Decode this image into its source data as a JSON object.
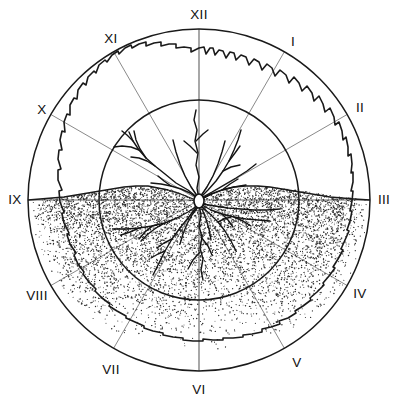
{
  "figure": {
    "background_color": "#ffffff",
    "line_color": "#1a1a1a",
    "spoke_color": "#8a8a8a",
    "stipple_color": "#2b2b2b"
  },
  "geometry": {
    "center_x": 199,
    "center_y": 200,
    "outer_radius": 171,
    "inner_radius": 100,
    "collar_radius_x": 5,
    "collar_radius_y": 7
  },
  "hour_labels": [
    {
      "id": "XII",
      "text": "XII",
      "angle_deg": 0,
      "x": 199,
      "y": 14
    },
    {
      "id": "I",
      "text": "I",
      "angle_deg": 30,
      "x": 293,
      "y": 41
    },
    {
      "id": "II",
      "text": "II",
      "angle_deg": 60,
      "x": 359,
      "y": 108
    },
    {
      "id": "III",
      "text": "III",
      "angle_deg": 90,
      "x": 383,
      "y": 200
    },
    {
      "id": "IV",
      "text": "IV",
      "angle_deg": 120,
      "x": 359,
      "y": 294
    },
    {
      "id": "V",
      "text": "V",
      "angle_deg": 150,
      "x": 296,
      "y": 363
    },
    {
      "id": "VI",
      "text": "VI",
      "angle_deg": 180,
      "x": 199,
      "y": 390
    },
    {
      "id": "VII",
      "text": "VII",
      "angle_deg": 210,
      "x": 110,
      "y": 370
    },
    {
      "id": "VIII",
      "text": "VIII",
      "angle_deg": 240,
      "x": 37,
      "y": 296
    },
    {
      "id": "IX",
      "text": "IX",
      "angle_deg": 270,
      "x": 14,
      "y": 200
    },
    {
      "id": "X",
      "text": "X",
      "angle_deg": 300,
      "x": 41,
      "y": 110
    },
    {
      "id": "XI",
      "text": "XI",
      "angle_deg": 330,
      "x": 110,
      "y": 38
    }
  ],
  "rings": [
    {
      "name": "outer-ring",
      "radius": 171
    },
    {
      "name": "inner-ring",
      "radius": 100
    }
  ],
  "chart_data": {
    "type": "line",
    "xlabel": "Hour sector (Roman numeral)",
    "ylabel": "Radial extent (fraction of outer radius)",
    "categories": [
      "XII",
      "I",
      "II",
      "III",
      "IV",
      "V",
      "VI",
      "VII",
      "VIII",
      "IX",
      "X",
      "XI"
    ],
    "axis_range": [
      0,
      1
    ],
    "grid": true,
    "legend_position": "none",
    "series": [
      {
        "name": "outer ring",
        "values": [
          1.0,
          1.0,
          1.0,
          1.0,
          1.0,
          1.0,
          1.0,
          1.0,
          1.0,
          1.0,
          1.0,
          1.0
        ]
      },
      {
        "name": "crown / root spread outline",
        "values": [
          0.88,
          0.85,
          0.84,
          0.87,
          0.86,
          0.83,
          0.8,
          0.84,
          0.86,
          0.88,
          0.87,
          0.88
        ]
      },
      {
        "name": "inner ring",
        "values": [
          0.585,
          0.585,
          0.585,
          0.585,
          0.585,
          0.585,
          0.585,
          0.585,
          0.585,
          0.585,
          0.585,
          0.585
        ]
      }
    ],
    "annotations": [
      {
        "label": "soil surface",
        "position": "horizontal IX-III axis"
      },
      {
        "label": "stippled soil body",
        "position": "lower half, density fading with depth"
      },
      {
        "label": "root collar",
        "position": "center"
      }
    ]
  }
}
